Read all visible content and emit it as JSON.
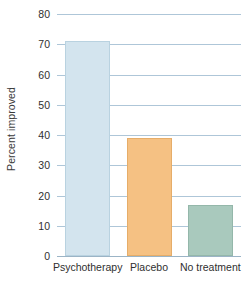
{
  "chart_data": {
    "type": "bar",
    "title": "",
    "xlabel": "",
    "ylabel": "Percent improved",
    "categories": [
      "Psychotherapy",
      "Placebo",
      "No treatment"
    ],
    "values": [
      71,
      39,
      17
    ],
    "ylim": [
      0,
      80
    ],
    "yticks": [
      0,
      10,
      20,
      30,
      40,
      50,
      60,
      70,
      80
    ],
    "ytick_labels": [
      "0",
      "10",
      "20",
      "30",
      "40",
      "50",
      "60",
      "70",
      "80"
    ],
    "grid": true,
    "legend": "none",
    "series": [
      {
        "name": "Percent improved",
        "values": [
          71,
          39,
          17
        ]
      }
    ],
    "bar_colors": [
      "#d3e4ee",
      "#f5c183",
      "#a9c9bd"
    ],
    "bar_border_colors": [
      "#b9d2e0",
      "#e6ad69",
      "#94b7aa"
    ],
    "gridline_color": "#aec6d8",
    "text_color": "#2f2f2f"
  }
}
